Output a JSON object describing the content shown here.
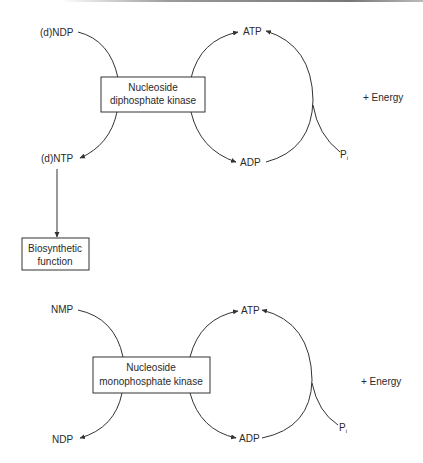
{
  "panel_top": {
    "substrate_in": "(d)NDP",
    "product_out": "(d)NTP",
    "enzyme_line1": "Nucleoside",
    "enzyme_line2": "diphosphate kinase",
    "cycle_top": "ATP",
    "cycle_bottom": "ADP",
    "phosphate": "P",
    "phosphate_sub": "i",
    "energy": "+ Energy",
    "downstream_line1": "Biosynthetic",
    "downstream_line2": "function"
  },
  "panel_bottom": {
    "substrate_in": "NMP",
    "product_out": "NDP",
    "enzyme_line1": "Nucleoside",
    "enzyme_line2": "monophosphate kinase",
    "cycle_top": "ATP",
    "cycle_bottom": "ADP",
    "phosphate": "P",
    "phosphate_sub": "i",
    "energy": "+ Energy"
  }
}
